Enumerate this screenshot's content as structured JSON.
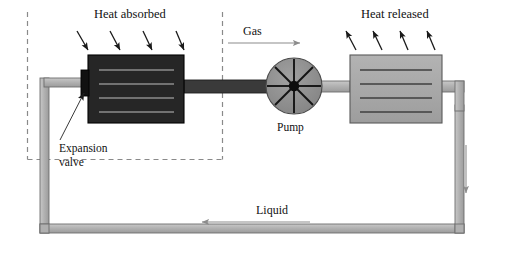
{
  "diagram": {
    "labels": {
      "heat_absorbed": "Heat absorbed",
      "heat_released": "Heat released",
      "gas": "Gas",
      "liquid": "Liquid",
      "pump": "Pump",
      "expansion_valve_line1": "Expansion",
      "expansion_valve_line2": "valve"
    },
    "colors": {
      "evaporator_fill": "#262626",
      "evaporator_stroke": "#000000",
      "condenser_fill": "#a8a8a8",
      "condenser_stroke": "#5a5a5a",
      "pipe_fill": "#b4b4b4",
      "pipe_stroke": "#6e6e6e",
      "pump_fill": "#8f8f8f",
      "pump_stroke": "#4a4a4a",
      "valve_fill": "#1a1a1a",
      "dashed_stroke": "#8a8a8a",
      "arrow_dark": "#1a1a1a",
      "arrow_light": "#8c8c8c",
      "text": "#111111",
      "background": "#ffffff"
    },
    "components": [
      {
        "name": "evaporator",
        "role": "heat-absorbing coil",
        "fins": 4
      },
      {
        "name": "condenser",
        "role": "heat-releasing coil",
        "fins": 4
      },
      {
        "name": "pump",
        "role": "compressor",
        "spokes": 8
      },
      {
        "name": "expansion-valve",
        "role": "throttle"
      },
      {
        "name": "pipe-loop",
        "role": "refrigerant circuit"
      }
    ],
    "heat_arrows": {
      "absorbed_count": 4,
      "released_count": 4,
      "absorbed_direction": "down-right into evaporator",
      "released_direction": "up-left out of condenser"
    },
    "flow_arrows": [
      {
        "name": "gas-flow-arrow",
        "direction": "right",
        "label": "Gas"
      },
      {
        "name": "liquid-flow-arrow",
        "direction": "left",
        "label": "Liquid"
      },
      {
        "name": "right-downflow-arrow",
        "direction": "down",
        "label": ""
      }
    ],
    "dashed_region": {
      "name": "cold-enclosure-boundary",
      "style": "dashed"
    }
  }
}
